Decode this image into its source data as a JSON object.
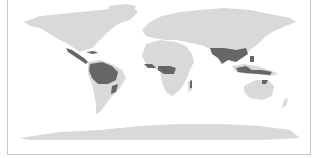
{
  "map": {
    "title": "World map",
    "projection": "equirectangular",
    "colors": {
      "background": "#ffffff",
      "land": "#d9d9d9",
      "highlight": "#666666",
      "frame": "#c8c8c8"
    },
    "legend": {
      "land_label": "Land",
      "highlight_label": "Highlighted tropical regions"
    },
    "highlighted_regions": [
      "Central America",
      "Caribbean",
      "Amazon basin (South America)",
      "Atlantic coast of Brazil",
      "West Africa coast",
      "Central Africa (Congo basin)",
      "Madagascar (east)",
      "South Asia (India)",
      "Southeast Asia",
      "Indonesia / Maritime Southeast Asia",
      "Papua New Guinea",
      "Northern Australia coast"
    ]
  }
}
